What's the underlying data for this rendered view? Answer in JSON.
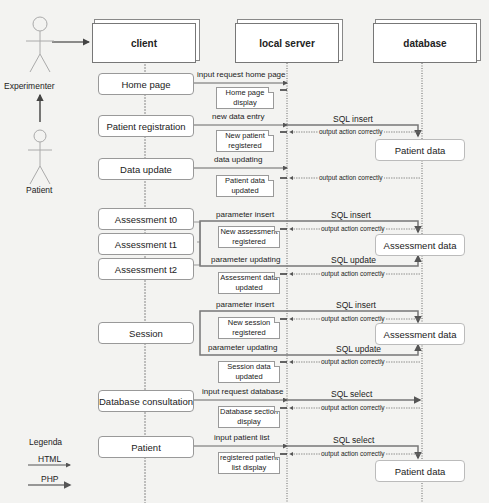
{
  "actors": {
    "experimenter": "Experimenter",
    "patient": "Patient"
  },
  "lifelines": {
    "client": "client",
    "local_server": "local server",
    "database": "database"
  },
  "client_steps": [
    "Home page",
    "Patient registration",
    "Data update",
    "Assessment t0",
    "Assessment t1",
    "Assessment t2",
    "Session",
    "Database consultation",
    "Patient"
  ],
  "requests": [
    "input request home page",
    "new data entry",
    "data updating",
    "parameter insert",
    "parameter updating",
    "parameter insert",
    "parameter updating",
    "input request database",
    "input patient list"
  ],
  "notes": [
    "Home page display",
    "New patient registered",
    "Patient data updated",
    "New assessment registered",
    "Assessment data updated",
    "New session registered",
    "Session data updated",
    "Database section display",
    "registered patient list display"
  ],
  "sql": [
    "SQL insert",
    "SQL insert",
    "SQL update",
    "SQL insert",
    "SQL update",
    "SQL select",
    "SQL select"
  ],
  "output_label": "output action correctly",
  "database_boxes": [
    "Patient data",
    "Assessment data",
    "Assessment data",
    "Patient data"
  ],
  "legend": {
    "title": "Legenda",
    "items": [
      "HTML",
      "PHP"
    ]
  },
  "colors": {
    "background": "#f3f3f1",
    "line": "#555555",
    "box_border": "#999999"
  }
}
